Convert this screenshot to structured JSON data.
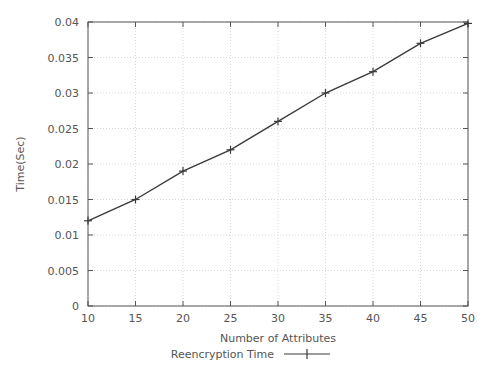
{
  "chart_data": {
    "type": "line",
    "title": "",
    "xlabel": "Number of Attributes",
    "ylabel": "Time(Sec)",
    "x": [
      10,
      15,
      20,
      25,
      30,
      35,
      40,
      45,
      50
    ],
    "values": [
      0.012,
      0.015,
      0.019,
      0.022,
      0.026,
      0.03,
      0.033,
      0.037,
      0.0398
    ],
    "series": [
      {
        "name": "Reencryption Time",
        "values": [
          0.012,
          0.015,
          0.019,
          0.022,
          0.026,
          0.03,
          0.033,
          0.037,
          0.0398
        ]
      }
    ],
    "xlim": [
      10,
      50
    ],
    "ylim": [
      0,
      0.04
    ],
    "xticks": [
      10,
      15,
      20,
      25,
      30,
      35,
      40,
      45,
      50
    ],
    "xtick_labels": [
      "10",
      "15",
      "20",
      "25",
      "30",
      "35",
      "40",
      "45",
      "50"
    ],
    "yticks": [
      0,
      0.005,
      0.01,
      0.015,
      0.02,
      0.025,
      0.03,
      0.035,
      0.04
    ],
    "ytick_labels": [
      "0",
      "0.005",
      "0.01",
      "0.015",
      "0.02",
      "0.025",
      "0.03",
      "0.035",
      "0.04"
    ],
    "grid": true,
    "grid_style": "dotted",
    "legend_position": "below-axis",
    "legend": [
      {
        "label": "Reencryption Time",
        "marker": "plus",
        "color": "#3a3a3a"
      }
    ],
    "colors": {
      "series_line": "#3a3a3a",
      "axis": "#555555",
      "grid": "#d8d8d8",
      "text": "#555555",
      "background": "#ffffff"
    }
  }
}
